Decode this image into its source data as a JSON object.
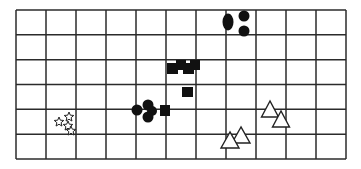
{
  "diagram": {
    "type": "grid-clusters",
    "background": "#ffffff",
    "grid": {
      "left": 16,
      "top": 10,
      "right": 346,
      "bottom": 159,
      "columns": 11,
      "rows": 6,
      "line_color": "#2b2b2b",
      "line_width": 1.5
    },
    "shape_colors": {
      "filled": "#111111",
      "outline": "#222222",
      "hollow_fill": "#ffffff"
    },
    "clusters": [
      {
        "name": "circles-top",
        "shape": "circle",
        "style": "filled",
        "items": [
          {
            "cx": 228,
            "cy": 22,
            "rx": 5.5,
            "ry": 8.5
          },
          {
            "cx": 244,
            "cy": 16,
            "rx": 5.5,
            "ry": 5.5
          },
          {
            "cx": 244,
            "cy": 31,
            "rx": 5.5,
            "ry": 5.5
          }
        ]
      },
      {
        "name": "squares-center",
        "shape": "square",
        "style": "filled",
        "items": [
          {
            "x": 167,
            "y": 63,
            "w": 11,
            "h": 11
          },
          {
            "x": 176,
            "y": 60,
            "w": 10,
            "h": 10
          },
          {
            "x": 183,
            "y": 63,
            "w": 11,
            "h": 11
          },
          {
            "x": 190,
            "y": 60,
            "w": 10,
            "h": 10
          },
          {
            "x": 182,
            "y": 87,
            "w": 11,
            "h": 10
          },
          {
            "x": 160,
            "y": 105,
            "w": 10,
            "h": 11
          }
        ]
      },
      {
        "name": "circles-middle",
        "shape": "circle",
        "style": "filled",
        "items": [
          {
            "cx": 137,
            "cy": 110,
            "rx": 5.5,
            "ry": 5.5
          },
          {
            "cx": 148,
            "cy": 105,
            "rx": 5.5,
            "ry": 5.5
          },
          {
            "cx": 152,
            "cy": 111,
            "rx": 5,
            "ry": 5
          },
          {
            "cx": 148,
            "cy": 117,
            "rx": 5.5,
            "ry": 5.5
          }
        ]
      },
      {
        "name": "stars-left",
        "shape": "star",
        "style": "hollow",
        "items": [
          {
            "cx": 59,
            "cy": 122,
            "r": 5
          },
          {
            "cx": 69,
            "cy": 117,
            "r": 5
          },
          {
            "cx": 68,
            "cy": 126,
            "r": 5
          },
          {
            "cx": 71,
            "cy": 131,
            "r": 5
          }
        ]
      },
      {
        "name": "triangles-right",
        "shape": "triangle",
        "style": "hollow",
        "items": [
          {
            "cx": 270,
            "top": 101,
            "bottom": 117,
            "half_w": 8.5
          },
          {
            "cx": 281,
            "top": 111,
            "bottom": 127,
            "half_w": 8.5
          },
          {
            "cx": 241,
            "top": 127,
            "bottom": 143,
            "half_w": 9
          },
          {
            "cx": 230,
            "top": 132,
            "bottom": 148,
            "half_w": 9
          }
        ]
      }
    ]
  }
}
